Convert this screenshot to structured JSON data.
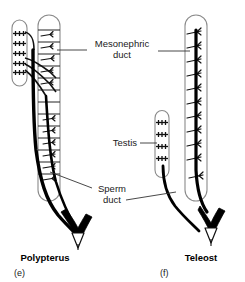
{
  "figure": {
    "type": "anatomical-diagram",
    "background_color": "#ffffff",
    "outline_color": "#8a8a8a",
    "tubule_color": "#1a1a1a",
    "duct_color": "#000000"
  },
  "labels": {
    "mesonephric_duct": {
      "line1": "Mesonephric",
      "line2": "duct"
    },
    "testis": {
      "line1": "Testis"
    },
    "sperm_duct": {
      "line1": "Sperm",
      "line2": "duct"
    }
  },
  "panels": [
    {
      "id": "e",
      "name": "Polypterus",
      "caption": "Polypterus",
      "letter": "(e)",
      "parts": {
        "testis_label": "testis",
        "kidney_label": "mesonephros",
        "duct_label": "mesonephric duct",
        "papilla_label": "urogenital papilla"
      },
      "testis_lobule_count": 5,
      "kidney_tubule_count": 13
    },
    {
      "id": "f",
      "name": "Teleost",
      "caption": "Teleost",
      "letter": "(f)",
      "parts": {
        "testis_label": "testis",
        "kidney_label": "mesonephros",
        "duct_label": "mesonephric duct",
        "papilla_label": "urogenital papilla"
      },
      "testis_lobule_count": 4,
      "kidney_tubule_count": 11
    }
  ]
}
